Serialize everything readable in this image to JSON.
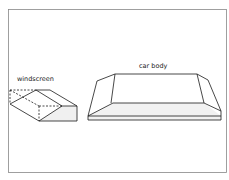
{
  "labels": {
    "windscreen": "windscreen",
    "car_body": "car body"
  },
  "colors": {
    "line": "#1a1a1a",
    "frame": "#777777",
    "background": "#ffffff",
    "shade": "#eeeeee"
  }
}
